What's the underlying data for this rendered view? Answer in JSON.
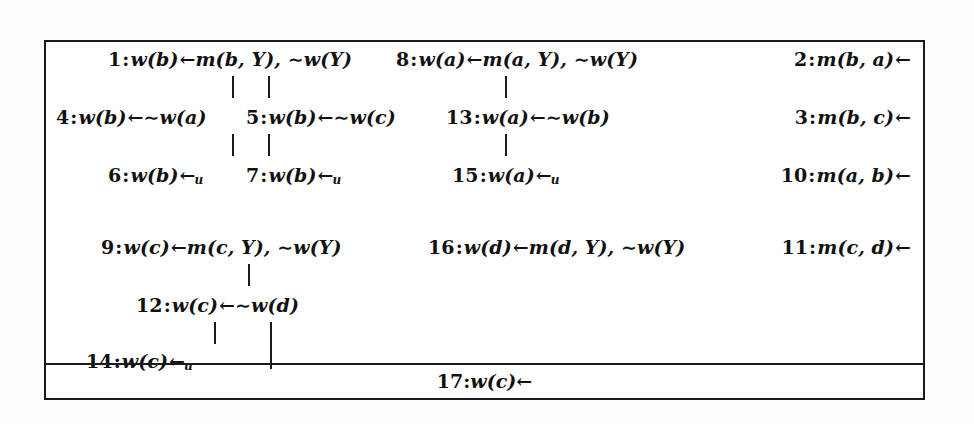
{
  "figure": {
    "type": "sld-derivation-tree",
    "ink_color": "#1a1a1a",
    "background_color": "#ffffff"
  },
  "clauses": {
    "c1": {
      "index": "1",
      "head": "w(b)",
      "arrow": "←",
      "body": "m(b, Y), ∼w(Y)",
      "text": "1: w(b)←m(b, Y), ∼w(Y)"
    },
    "c4": {
      "index": "4",
      "head": "w(b)",
      "arrow": "←",
      "body": "∼w(a)",
      "text": "4: w(b)←∼w(a)"
    },
    "c5": {
      "index": "5",
      "head": "w(b)",
      "arrow": "←",
      "body": "∼w(c)",
      "text": "5: w(b)←∼w(c)"
    },
    "c6": {
      "index": "6",
      "head": "w(b)",
      "arrow": "←",
      "subscript": "u",
      "body": "",
      "text": "6: w(b)←u"
    },
    "c7": {
      "index": "7",
      "head": "w(b)",
      "arrow": "←",
      "subscript": "u",
      "body": "",
      "text": "7: w(b)←u"
    },
    "c8": {
      "index": "8",
      "head": "w(a)",
      "arrow": "←",
      "body": "m(a, Y), ∼w(Y)",
      "text": "8: w(a)←m(a, Y), ∼w(Y)"
    },
    "c13": {
      "index": "13",
      "head": "w(a)",
      "arrow": "←",
      "body": "∼w(b)",
      "text": "13: w(a)←∼w(b)"
    },
    "c15": {
      "index": "15",
      "head": "w(a)",
      "arrow": "←",
      "subscript": "u",
      "body": "",
      "text": "15: w(a)←u"
    },
    "c2": {
      "index": "2",
      "head": "m(b, a)",
      "arrow": "←",
      "body": "",
      "text": "2: m(b, a)←"
    },
    "c3": {
      "index": "3",
      "head": "m(b, c)",
      "arrow": "←",
      "body": "",
      "text": "3: m(b, c)←"
    },
    "c10": {
      "index": "10",
      "head": "m(a, b)",
      "arrow": "←",
      "body": "",
      "text": "10: m(a, b)←"
    },
    "c9": {
      "index": "9",
      "head": "w(c)",
      "arrow": "←",
      "body": "m(c, Y), ∼w(Y)",
      "text": "9: w(c)←m(c, Y), ∼w(Y)"
    },
    "c16": {
      "index": "16",
      "head": "w(d)",
      "arrow": "←",
      "body": "m(d, Y), ∼w(Y)",
      "text": "16: w(d)←m(d, Y), ∼w(Y)"
    },
    "c11": {
      "index": "11",
      "head": "m(c, d)",
      "arrow": "←",
      "body": "",
      "text": "11: m(c, d)←"
    },
    "c12": {
      "index": "12",
      "head": "w(c)",
      "arrow": "←",
      "body": "∼w(d)",
      "text": "12: w(c)←∼w(d)"
    },
    "c14": {
      "index": "14",
      "head": "w(c)",
      "arrow": "←",
      "subscript": "u",
      "body": "",
      "text": "14: w(c)←u"
    },
    "c17": {
      "index": "17",
      "head": "w(c)",
      "arrow": "←",
      "body": "",
      "text": "17: w(c)←"
    }
  },
  "symbols": {
    "left_arrow": "←",
    "negation": "∼",
    "colon": ":",
    "undefined_subscript": "u"
  }
}
